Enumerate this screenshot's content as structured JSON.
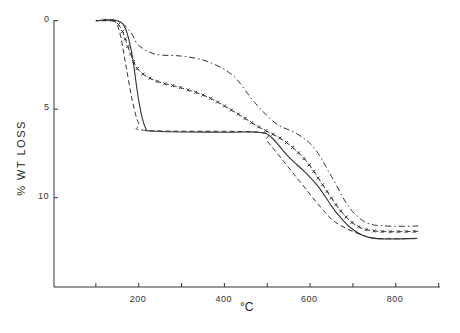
{
  "chart_data": {
    "type": "line",
    "title": "",
    "xlabel": "°C",
    "ylabel": "% WT LOSS",
    "xlim": [
      0,
      900
    ],
    "ylim": [
      0,
      15
    ],
    "y_inverted": true,
    "grid": false,
    "legend": null,
    "x_ticks": [
      100,
      200,
      300,
      400,
      500,
      600,
      700,
      800,
      900
    ],
    "x_tick_labels": {
      "200": "200",
      "400": "400",
      "600": "600",
      "800": "800"
    },
    "y_ticks": [
      0,
      5,
      10
    ],
    "y_tick_labels": [
      "0",
      "5",
      "10"
    ],
    "series": [
      {
        "name": "solid",
        "style": "solid",
        "x": [
          100,
          150,
          170,
          185,
          200,
          215,
          240,
          400,
          480,
          510,
          550,
          590,
          620,
          660,
          700,
          750,
          850
        ],
        "y": [
          0,
          0,
          0.5,
          2,
          4.5,
          6,
          6.25,
          6.3,
          6.3,
          6.6,
          7.7,
          8.6,
          9.4,
          10.8,
          11.8,
          12.3,
          12.3
        ]
      },
      {
        "name": "dashed",
        "style": "dashed",
        "x": [
          100,
          140,
          155,
          170,
          185,
          200,
          220,
          480,
          500,
          540,
          580,
          620,
          660,
          720,
          760,
          850
        ],
        "y": [
          0,
          0,
          0.6,
          2.5,
          4.5,
          5.8,
          6.2,
          6.3,
          6.8,
          8,
          9.2,
          10.4,
          11.4,
          12.1,
          12.3,
          12.3
        ]
      },
      {
        "name": "dash-cross",
        "style": "dash-cross",
        "x": [
          100,
          140,
          160,
          180,
          200,
          240,
          300,
          360,
          420,
          480,
          540,
          590,
          630,
          670,
          710,
          760,
          860
        ],
        "y": [
          0,
          0,
          0.5,
          1.8,
          2.8,
          3.4,
          3.8,
          4.3,
          5.1,
          6.0,
          6.8,
          7.9,
          9.3,
          10.7,
          11.6,
          11.9,
          11.9
        ]
      },
      {
        "name": "dash-dot",
        "style": "dash-dot",
        "x": [
          100,
          150,
          180,
          200,
          240,
          300,
          360,
          420,
          470,
          520,
          570,
          610,
          650,
          690,
          730,
          780,
          860
        ],
        "y": [
          0,
          0,
          0.6,
          1.4,
          1.9,
          2.0,
          2.3,
          3.1,
          4.6,
          5.8,
          6.4,
          7.2,
          8.8,
          10.5,
          11.4,
          11.6,
          11.6
        ]
      }
    ]
  },
  "axes": {
    "xlabel": "°C",
    "ylabel": "% WT LOSS",
    "x_labels": [
      {
        "text": "200",
        "value": 200
      },
      {
        "text": "400",
        "value": 400
      },
      {
        "text": "600",
        "value": 600
      },
      {
        "text": "800",
        "value": 800
      }
    ],
    "y_labels": [
      {
        "text": "0",
        "value": 0
      },
      {
        "text": "5",
        "value": 5
      },
      {
        "text": "10",
        "value": 10
      }
    ]
  }
}
